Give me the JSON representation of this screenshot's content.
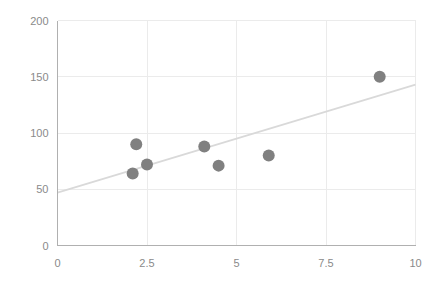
{
  "chart_data": {
    "type": "scatter",
    "title": "",
    "subtitle": "",
    "xlabel": "",
    "ylabel": "",
    "xlim": [
      0,
      10
    ],
    "ylim": [
      0,
      200
    ],
    "grid": true,
    "legend": null,
    "x_ticks": [
      "0",
      "2.5",
      "5",
      "7.5",
      "10"
    ],
    "x_tick_values": [
      0,
      2.5,
      5,
      7.5,
      10
    ],
    "y_ticks": [
      "0",
      "50",
      "100",
      "150",
      "200"
    ],
    "y_tick_values": [
      0,
      50,
      100,
      150,
      200
    ],
    "series": [
      {
        "name": "points",
        "marker": "circle",
        "color": "#808080",
        "points": [
          {
            "x": 2.1,
            "y": 64
          },
          {
            "x": 2.2,
            "y": 90
          },
          {
            "x": 2.5,
            "y": 72
          },
          {
            "x": 4.1,
            "y": 88
          },
          {
            "x": 4.5,
            "y": 71
          },
          {
            "x": 5.9,
            "y": 80
          },
          {
            "x": 9.0,
            "y": 150
          }
        ]
      }
    ],
    "trendline": {
      "name": "linear-fit",
      "color": "#d9d9d9",
      "x0": 0,
      "y0": 47,
      "x1": 10,
      "y1": 143
    },
    "colors": {
      "marker": "#808080",
      "trendline": "#d9d9d9",
      "gridline": "#ebebeb",
      "axis": "#b0b0b0",
      "tick_text": "#8a8a8a",
      "background": "#ffffff"
    }
  }
}
